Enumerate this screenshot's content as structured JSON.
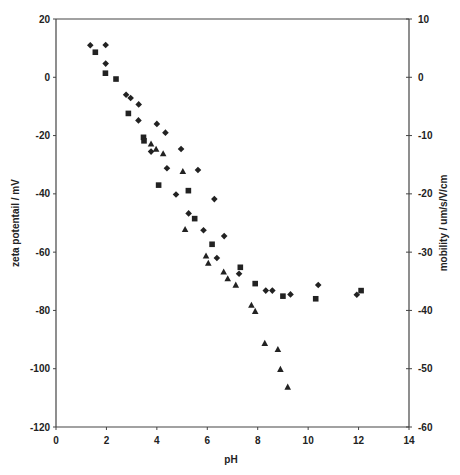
{
  "chart_data": {
    "type": "scatter",
    "title": "",
    "xlabel": "pH",
    "ylabel": "zeta potentail / mV",
    "y2label": "mobility / um/s/V/cm",
    "xlim": [
      0,
      14
    ],
    "ylim": [
      -120,
      20
    ],
    "y2lim": [
      -60,
      10
    ],
    "xticks": [
      0,
      2,
      4,
      6,
      8,
      10,
      12,
      14
    ],
    "yticks": [
      20,
      0,
      -20,
      -40,
      -60,
      -80,
      -100,
      -120
    ],
    "y2ticks": [
      10,
      0,
      -10,
      -20,
      -30,
      -40,
      -50,
      -60
    ],
    "grid": false,
    "legend": null,
    "series": [
      {
        "name": "diamond",
        "marker": "diamond",
        "points": [
          [
            1.36,
            11.0
          ],
          [
            1.97,
            11.1
          ],
          [
            1.97,
            4.7
          ],
          [
            2.78,
            -6.0
          ],
          [
            2.96,
            -7.1
          ],
          [
            3.28,
            -9.3
          ],
          [
            3.27,
            -14.8
          ],
          [
            4.0,
            -16.0
          ],
          [
            4.34,
            -19.0
          ],
          [
            3.77,
            -25.5
          ],
          [
            4.96,
            -24.6
          ],
          [
            4.4,
            -31.2
          ],
          [
            5.63,
            -31.8
          ],
          [
            4.76,
            -40.2
          ],
          [
            6.28,
            -41.8
          ],
          [
            5.26,
            -46.7
          ],
          [
            5.85,
            -52.5
          ],
          [
            6.67,
            -54.5
          ],
          [
            6.38,
            -62.0
          ],
          [
            7.26,
            -67.4
          ],
          [
            8.32,
            -73.2
          ],
          [
            8.58,
            -73.2
          ],
          [
            9.3,
            -74.5
          ],
          [
            10.4,
            -71.3
          ],
          [
            11.93,
            -74.6
          ]
        ]
      },
      {
        "name": "square",
        "marker": "square",
        "points": [
          [
            1.56,
            8.6
          ],
          [
            1.96,
            1.4
          ],
          [
            2.38,
            -0.6
          ],
          [
            2.87,
            -12.4
          ],
          [
            3.47,
            -20.6
          ],
          [
            3.49,
            -21.8
          ],
          [
            4.07,
            -37.0
          ],
          [
            5.25,
            -38.9
          ],
          [
            5.5,
            -48.5
          ],
          [
            6.19,
            -57.3
          ],
          [
            7.31,
            -65.2
          ],
          [
            7.9,
            -70.8
          ],
          [
            9.0,
            -75.1
          ],
          [
            10.3,
            -76.0
          ],
          [
            12.1,
            -73.2
          ]
        ]
      },
      {
        "name": "triangle",
        "marker": "triangle",
        "points": [
          [
            3.77,
            -22.9
          ],
          [
            3.97,
            -24.7
          ],
          [
            4.25,
            -26.2
          ],
          [
            5.03,
            -32.3
          ],
          [
            5.12,
            -52.2
          ],
          [
            5.95,
            -61.3
          ],
          [
            6.04,
            -63.8
          ],
          [
            6.65,
            -66.8
          ],
          [
            6.81,
            -69.1
          ],
          [
            7.13,
            -71.3
          ],
          [
            7.75,
            -78.2
          ],
          [
            7.9,
            -80.3
          ],
          [
            8.28,
            -91.3
          ],
          [
            8.8,
            -93.4
          ],
          [
            8.9,
            -100.2
          ],
          [
            9.19,
            -106.3
          ]
        ]
      }
    ]
  },
  "colors": {
    "marker": "#222222",
    "axis": "#444444",
    "background": "#ffffff"
  }
}
